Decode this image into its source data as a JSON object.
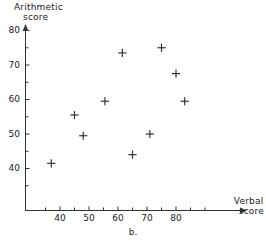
{
  "figure": {
    "caption": "b.",
    "ink_color": "#333333"
  },
  "axes": {
    "y_title_line1": "Arithmetic",
    "y_title_line2": "score",
    "x_title_line1": "Verbal",
    "x_title_line2": "score"
  },
  "chart_data": {
    "type": "scatter",
    "title": "",
    "subtitle": "b.",
    "xlabel": "Verbal score",
    "ylabel": "Arithmetic score",
    "xlim": [
      31,
      90
    ],
    "ylim": [
      33,
      82
    ],
    "xticks": [
      40,
      50,
      60,
      70,
      80
    ],
    "yticks": [
      40,
      50,
      60,
      70,
      80
    ],
    "xticklabels": [
      "40",
      "50",
      "60",
      "70",
      "80"
    ],
    "yticklabels": [
      "40",
      "50",
      "60",
      "70",
      "80"
    ],
    "minor_tick_step": 5,
    "grid": false,
    "legend": null,
    "marker": "plus",
    "marker_color": "#333333",
    "points": [
      {
        "x": 37,
        "y": 41.5
      },
      {
        "x": 45,
        "y": 55.5
      },
      {
        "x": 48,
        "y": 49.5
      },
      {
        "x": 55.5,
        "y": 59.5
      },
      {
        "x": 61.5,
        "y": 73.5
      },
      {
        "x": 65,
        "y": 44
      },
      {
        "x": 71,
        "y": 50
      },
      {
        "x": 75,
        "y": 75
      },
      {
        "x": 80,
        "y": 67.5
      },
      {
        "x": 83,
        "y": 59.5
      }
    ]
  }
}
